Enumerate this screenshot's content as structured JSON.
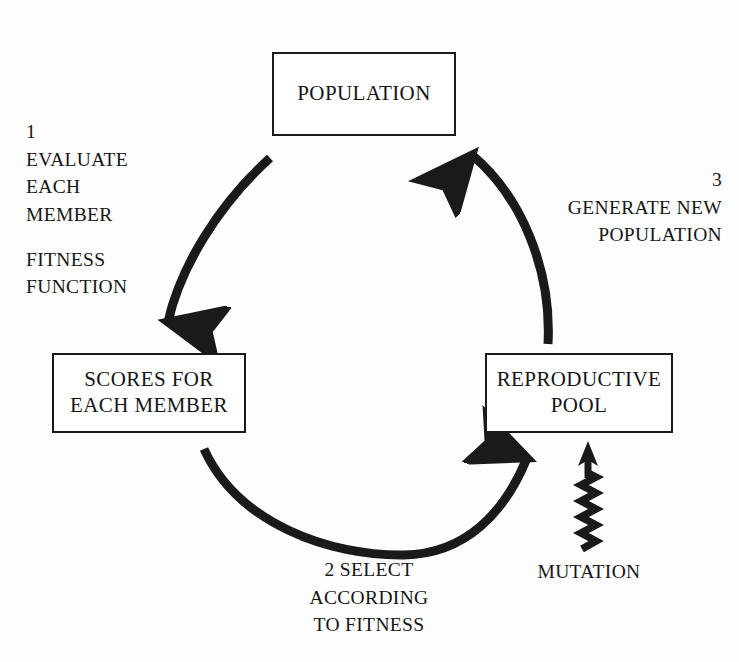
{
  "diagram": {
    "ink_color": "#1a1a1a",
    "background_color": "#fdfdfd",
    "nodes": [
      {
        "id": "population",
        "lines": [
          "POPULATION"
        ]
      },
      {
        "id": "scores",
        "lines": [
          "SCORES FOR",
          "EACH MEMBER"
        ]
      },
      {
        "id": "reproductive_pool",
        "lines": [
          "REPRODUCTIVE",
          "POOL"
        ]
      }
    ],
    "captions": {
      "evaluate": {
        "step": "1",
        "lines": [
          "EVALUATE",
          "EACH",
          "MEMBER"
        ],
        "extra_lines": [
          "FITNESS",
          "FUNCTION"
        ]
      },
      "generate": {
        "step": "3",
        "lines": [
          "GENERATE NEW",
          "POPULATION"
        ]
      },
      "select": {
        "lines": [
          "2   SELECT",
          "ACCORDING",
          "TO FITNESS"
        ]
      },
      "mutation": {
        "label": "MUTATION"
      }
    },
    "arrows": [
      {
        "id": "population-to-scores",
        "from": "POPULATION",
        "to": "SCORES FOR EACH MEMBER",
        "style": "curved",
        "direction": "down-left"
      },
      {
        "id": "scores-to-pool",
        "from": "SCORES FOR EACH MEMBER",
        "to": "REPRODUCTIVE POOL",
        "style": "curved",
        "direction": "right-up"
      },
      {
        "id": "pool-to-population",
        "from": "REPRODUCTIVE POOL",
        "to": "POPULATION",
        "style": "curved",
        "direction": "up-left"
      },
      {
        "id": "mutation-to-pool",
        "from": "MUTATION",
        "to": "REPRODUCTIVE POOL",
        "style": "zigzag",
        "direction": "up"
      }
    ]
  }
}
